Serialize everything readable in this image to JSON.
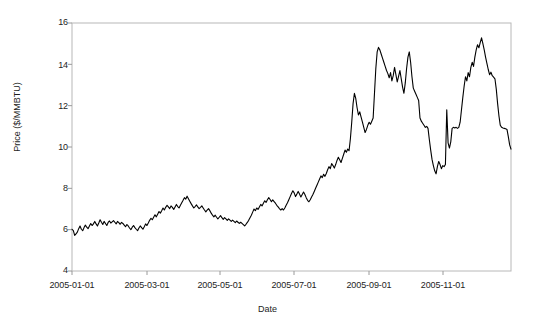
{
  "chart_data": {
    "type": "line",
    "title": "",
    "xlabel": "Date",
    "ylabel": "Price ($/MMBTU)",
    "ylim": [
      4,
      16
    ],
    "yticks": [
      4,
      6,
      8,
      10,
      12,
      14,
      16
    ],
    "ytick_labels": [
      "4",
      "6",
      "8",
      "10",
      "12",
      "14",
      "16"
    ],
    "xlim": [
      "2005-01-01",
      "2005-12-30"
    ],
    "xticks": [
      "2005-01-01",
      "2005-03-01",
      "2005-05-01",
      "2005-07-01",
      "2005-09-01",
      "2005-11-01"
    ],
    "xtick_labels": [
      "2005-01-01",
      "2005-03-01",
      "2005-05-01",
      "2005-07-01",
      "2005-09-01",
      "2005-11-01"
    ],
    "grid": false,
    "legend": false,
    "line_color": "#000000",
    "axis_color": "#b3b3b3",
    "background": "#ffffff",
    "series": [
      {
        "name": "Natural Gas Spot Price",
        "x_start_day": 0,
        "x_step_days": 1,
        "values": [
          6.02,
          5.95,
          5.72,
          5.8,
          5.88,
          6.05,
          6.18,
          6.02,
          5.95,
          6.1,
          6.22,
          6.12,
          6.05,
          6.18,
          6.3,
          6.2,
          6.28,
          6.4,
          6.28,
          6.18,
          6.32,
          6.48,
          6.36,
          6.25,
          6.4,
          6.3,
          6.2,
          6.35,
          6.42,
          6.32,
          6.38,
          6.44,
          6.36,
          6.28,
          6.4,
          6.34,
          6.26,
          6.35,
          6.3,
          6.22,
          6.14,
          6.25,
          6.18,
          6.08,
          6.0,
          6.12,
          6.2,
          6.1,
          6.02,
          5.95,
          6.08,
          6.18,
          6.1,
          6.02,
          6.14,
          6.28,
          6.2,
          6.32,
          6.45,
          6.55,
          6.48,
          6.6,
          6.72,
          6.62,
          6.75,
          6.88,
          6.8,
          6.92,
          7.05,
          6.95,
          7.08,
          7.18,
          7.1,
          7.02,
          7.15,
          7.08,
          6.98,
          7.1,
          7.22,
          7.12,
          7.05,
          7.18,
          7.3,
          7.42,
          7.55,
          7.48,
          7.62,
          7.5,
          7.38,
          7.26,
          7.15,
          7.05,
          7.12,
          7.2,
          7.1,
          7.02,
          7.08,
          7.15,
          7.05,
          6.95,
          6.86,
          6.95,
          7.02,
          6.92,
          6.8,
          6.7,
          6.62,
          6.7,
          6.6,
          6.52,
          6.6,
          6.68,
          6.58,
          6.5,
          6.58,
          6.52,
          6.45,
          6.52,
          6.46,
          6.4,
          6.46,
          6.4,
          6.34,
          6.42,
          6.36,
          6.3,
          6.36,
          6.3,
          6.24,
          6.18,
          6.26,
          6.35,
          6.45,
          6.58,
          6.7,
          6.85,
          7.0,
          6.92,
          7.05,
          6.98,
          7.1,
          7.22,
          7.15,
          7.28,
          7.4,
          7.32,
          7.45,
          7.55,
          7.46,
          7.35,
          7.44,
          7.36,
          7.28,
          7.18,
          7.1,
          7.02,
          6.95,
          7.02,
          6.95,
          7.05,
          7.18,
          7.3,
          7.45,
          7.6,
          7.75,
          7.88,
          7.78,
          7.6,
          7.72,
          7.85,
          7.72,
          7.58,
          7.7,
          7.82,
          7.7,
          7.55,
          7.42,
          7.35,
          7.45,
          7.58,
          7.7,
          7.85,
          8.0,
          8.15,
          8.3,
          8.45,
          8.6,
          8.52,
          8.68,
          8.58,
          8.72,
          8.9,
          9.05,
          8.95,
          9.2,
          9.1,
          8.98,
          9.15,
          9.35,
          9.5,
          9.38,
          9.25,
          9.45,
          9.65,
          9.85,
          9.75,
          9.9,
          9.82,
          10.4,
          11.2,
          12.1,
          12.6,
          12.35,
          11.9,
          11.55,
          11.7,
          11.45,
          11.2,
          10.95,
          10.7,
          10.85,
          11.05,
          11.2,
          11.1,
          11.25,
          11.4,
          12.6,
          13.8,
          14.6,
          14.82,
          14.7,
          14.5,
          14.3,
          14.1,
          13.9,
          13.7,
          13.55,
          13.35,
          13.6,
          13.2,
          13.45,
          13.85,
          13.5,
          13.15,
          13.42,
          13.7,
          13.3,
          12.9,
          12.6,
          13.1,
          13.8,
          14.35,
          14.6,
          14.1,
          13.4,
          12.85,
          12.7,
          12.55,
          12.4,
          12.25,
          11.4,
          11.25,
          11.15,
          11.05,
          10.95,
          11.0,
          10.9,
          10.35,
          9.85,
          9.4,
          9.1,
          8.85,
          8.7,
          9.05,
          9.3,
          9.15,
          8.95,
          9.1,
          9.05,
          9.15,
          11.8,
          10.2,
          9.95,
          10.25,
          10.9,
          10.95,
          10.92,
          10.95,
          10.9,
          10.95,
          11.2,
          11.8,
          12.4,
          12.95,
          13.4,
          13.2,
          13.6,
          13.4,
          13.85,
          14.1,
          13.9,
          14.35,
          14.7,
          14.95,
          14.8,
          15.05,
          15.28,
          15.0,
          14.7,
          14.35,
          14.05,
          13.75,
          13.5,
          13.62,
          13.45,
          13.38,
          13.3,
          12.8,
          12.1,
          11.5,
          11.05,
          10.95,
          10.92,
          10.9,
          10.88,
          10.85,
          10.5,
          10.1,
          9.9
        ]
      }
    ]
  },
  "axes": {
    "y_tick_positions": [
      271,
      230.7,
      189.7,
      148.7,
      107.7,
      66.7,
      23
    ],
    "x_tick_positions": [
      72,
      147,
      220,
      294,
      369,
      443
    ]
  }
}
